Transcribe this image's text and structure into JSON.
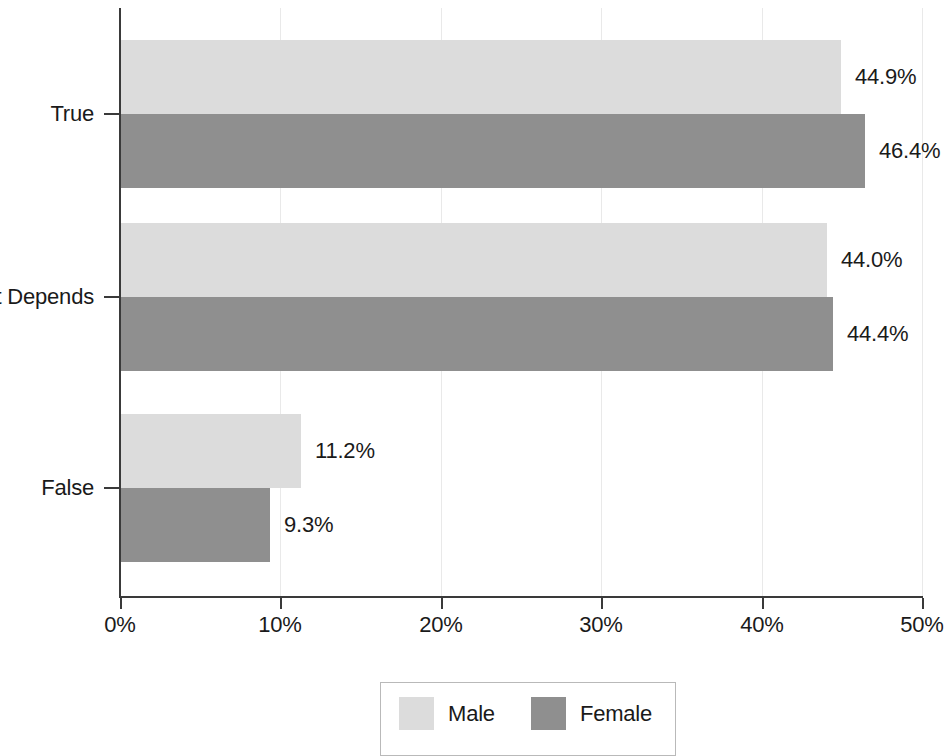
{
  "chart_data": {
    "type": "bar",
    "orientation": "horizontal",
    "title": "",
    "subtitle": "",
    "xlabel": "",
    "ylabel": "",
    "categories": [
      "True",
      "It Depends",
      "False"
    ],
    "series": [
      {
        "name": "Male",
        "color": "#dcdcdc",
        "values": [
          44.9,
          44.0,
          11.2
        ]
      },
      {
        "name": "Female",
        "color": "#8f8f8f",
        "values": [
          46.4,
          44.4,
          9.3
        ]
      }
    ],
    "value_labels": [
      [
        "44.9%",
        "44.0%",
        "11.2%"
      ],
      [
        "46.4%",
        "44.4%",
        "9.3%"
      ]
    ],
    "xlim": [
      0,
      50
    ],
    "xticks": [
      0,
      10,
      20,
      30,
      40,
      50
    ],
    "xtick_labels": [
      "0%",
      "10%",
      "20%",
      "30%",
      "40%",
      "50%"
    ],
    "grid": "vertical-only",
    "legend_position": "bottom-center",
    "legend_entries": [
      "Male",
      "Female"
    ]
  },
  "axis": {
    "x_tick_labels": [
      "0%",
      "10%",
      "20%",
      "30%",
      "40%",
      "50%"
    ],
    "y_tick_labels": [
      "True",
      "It Depends",
      "False"
    ]
  },
  "legend": {
    "entries": [
      {
        "label": "Male",
        "color": "#dcdcdc"
      },
      {
        "label": "Female",
        "color": "#8f8f8f"
      }
    ]
  },
  "colors": {
    "male": "#dcdcdc",
    "female": "#8f8f8f",
    "axis": "#3a3a3a",
    "grid": "#e9e9e9",
    "text": "#1a1a1a",
    "legend_border": "#b9b9b9",
    "background": "#ffffff"
  }
}
